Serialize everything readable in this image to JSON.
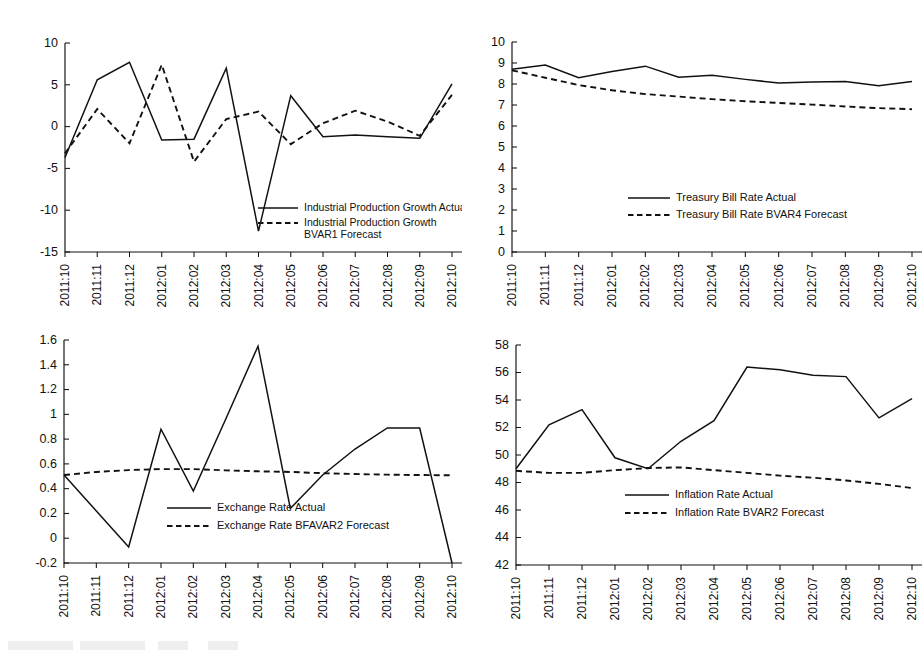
{
  "figure": {
    "title": "",
    "panel_count": 4
  },
  "shared": {
    "categories": [
      "2011:10",
      "2011:11",
      "2011:12",
      "2012:01",
      "2012:02",
      "2012:03",
      "2012:04",
      "2012:05",
      "2012:06",
      "2012:07",
      "2012:08",
      "2012:09",
      "2012:10"
    ]
  },
  "chart_data": [
    {
      "id": "industrial-production",
      "type": "line",
      "title": "",
      "xlabel": "",
      "ylabel": "",
      "ylim": [
        -15,
        10
      ],
      "yticks": [
        -15,
        -10,
        -5,
        0,
        5,
        10
      ],
      "ytick_labels": [
        "-15",
        "-10",
        "-5",
        "0",
        "5",
        "10"
      ],
      "grid": false,
      "legend_position": "lower-right",
      "categories": [
        "2011:10",
        "2011:11",
        "2011:12",
        "2012:01",
        "2012:02",
        "2012:03",
        "2012:04",
        "2012:05",
        "2012:06",
        "2012:07",
        "2012:08",
        "2012:09",
        "2012:10"
      ],
      "series": [
        {
          "name": "Industrial Production Growth Actual",
          "style": "solid",
          "values": [
            -3.7,
            5.6,
            7.7,
            -1.6,
            -1.5,
            7.0,
            -12.5,
            3.7,
            -1.2,
            -1.0,
            -1.2,
            -1.4,
            5.1
          ]
        },
        {
          "name": "Industrial Production Growth BVAR1 Forecast",
          "style": "dashed",
          "values": [
            -3.2,
            2.1,
            -2.0,
            7.4,
            -4.2,
            0.9,
            1.8,
            -2.1,
            0.4,
            1.9,
            0.6,
            -1.1,
            3.8
          ]
        }
      ]
    },
    {
      "id": "treasury-bill-rate",
      "type": "line",
      "title": "",
      "xlabel": "",
      "ylabel": "",
      "ylim": [
        0,
        10
      ],
      "yticks": [
        0,
        1,
        2,
        3,
        4,
        5,
        6,
        7,
        8,
        9,
        10
      ],
      "ytick_labels": [
        "0",
        "1",
        "2",
        "3",
        "4",
        "5",
        "6",
        "7",
        "8",
        "9",
        "10"
      ],
      "grid": false,
      "legend_position": "middle-center",
      "categories": [
        "2011:10",
        "2011:11",
        "2011:12",
        "2012:01",
        "2012:02",
        "2012:03",
        "2012:04",
        "2012:05",
        "2012:06",
        "2012:07",
        "2012:08",
        "2012:09",
        "2012:10"
      ],
      "series": [
        {
          "name": "Treasury Bill Rate Actual",
          "style": "solid",
          "values": [
            8.7,
            8.9,
            8.3,
            8.6,
            8.85,
            8.32,
            8.42,
            8.22,
            8.05,
            8.1,
            8.12,
            7.92,
            8.12
          ]
        },
        {
          "name": "Treasury Bill Rate BVAR4 Forecast",
          "style": "dashed",
          "values": [
            8.65,
            8.3,
            7.95,
            7.7,
            7.52,
            7.4,
            7.28,
            7.18,
            7.1,
            7.02,
            6.93,
            6.85,
            6.8
          ]
        }
      ]
    },
    {
      "id": "exchange-rate",
      "type": "line",
      "title": "",
      "xlabel": "",
      "ylabel": "",
      "ylim": [
        -0.2,
        1.6
      ],
      "yticks": [
        -0.2,
        0,
        0.2,
        0.4,
        0.6,
        0.8,
        1,
        1.2,
        1.4,
        1.6
      ],
      "ytick_labels": [
        "-0.2",
        "0",
        "0.2",
        "0.4",
        "0.6",
        "0.8",
        "1",
        "1.2",
        "1.4",
        "1.6"
      ],
      "grid": false,
      "legend_position": "lower-center",
      "categories": [
        "2011:10",
        "2011:11",
        "2011:12",
        "2012:01",
        "2012:02",
        "2012:03",
        "2012:04",
        "2012:05",
        "2012:06",
        "2012:07",
        "2012:08",
        "2012:09",
        "2012:10"
      ],
      "series": [
        {
          "name": "Exchange Rate Actual",
          "style": "solid",
          "values": [
            0.51,
            0.22,
            -0.07,
            0.88,
            0.38,
            0.96,
            1.55,
            0.24,
            0.51,
            0.72,
            0.89,
            0.89,
            -0.2
          ]
        },
        {
          "name": "Exchange Rate BFAVAR2 Forecast",
          "style": "dashed",
          "values": [
            0.51,
            0.535,
            0.55,
            0.558,
            0.558,
            0.548,
            0.54,
            0.535,
            0.525,
            0.518,
            0.513,
            0.51,
            0.508
          ]
        }
      ]
    },
    {
      "id": "inflation-rate",
      "type": "line",
      "title": "",
      "xlabel": "",
      "ylabel": "",
      "ylim": [
        42,
        58
      ],
      "yticks": [
        42,
        44,
        46,
        48,
        50,
        52,
        54,
        56,
        58
      ],
      "ytick_labels": [
        "42",
        "44",
        "46",
        "48",
        "50",
        "52",
        "54",
        "56",
        "58"
      ],
      "grid": false,
      "legend_position": "lower-center",
      "categories": [
        "2011:10",
        "2011:11",
        "2011:12",
        "2012:01",
        "2012:02",
        "2012:03",
        "2012:04",
        "2012:05",
        "2012:06",
        "2012:07",
        "2012:08",
        "2012:09",
        "2012:10"
      ],
      "series": [
        {
          "name": "Inflation Rate Actual",
          "style": "solid",
          "values": [
            49.0,
            52.2,
            53.3,
            49.8,
            49.0,
            51.0,
            52.5,
            56.4,
            56.2,
            55.8,
            55.7,
            52.7,
            54.1
          ]
        },
        {
          "name": "Inflation Rate BVAR2 Forecast",
          "style": "dashed",
          "values": [
            48.85,
            48.7,
            48.7,
            48.9,
            49.05,
            49.1,
            48.9,
            48.7,
            48.5,
            48.35,
            48.15,
            47.9,
            47.6
          ]
        }
      ]
    }
  ]
}
